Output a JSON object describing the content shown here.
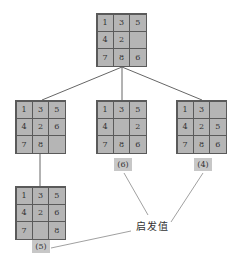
{
  "diagram": {
    "root": {
      "id": "root",
      "cells": [
        "1",
        "3",
        "5",
        "4",
        "2",
        "",
        "7",
        "8",
        "6"
      ]
    },
    "children": [
      {
        "id": "child-left",
        "cells": [
          "1",
          "3",
          "5",
          "4",
          "2",
          "6",
          "7",
          "8",
          ""
        ],
        "heuristic": null
      },
      {
        "id": "child-middle",
        "cells": [
          "1",
          "3",
          "5",
          "4",
          "",
          "2",
          "7",
          "8",
          "6"
        ],
        "heuristic": "(6)"
      },
      {
        "id": "child-right",
        "cells": [
          "1",
          "3",
          "",
          "4",
          "2",
          "5",
          "7",
          "8",
          "6"
        ],
        "heuristic": "(4)"
      }
    ],
    "grandchildren": [
      {
        "id": "grandchild-left",
        "parent": "child-left",
        "cells": [
          "1",
          "3",
          "5",
          "4",
          "2",
          "6",
          "7",
          "",
          "8"
        ],
        "heuristic": "(5)"
      }
    ],
    "annotation_label": "启发值"
  },
  "colors": {
    "tile_fill": "#b5b5b5",
    "grid_line": "#5a5a5a",
    "label_fill": "#c7c7c7",
    "edge_line": "#666666"
  }
}
